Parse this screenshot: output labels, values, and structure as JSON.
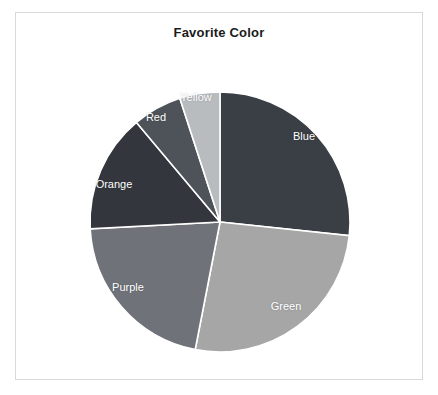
{
  "chart_data": {
    "type": "pie",
    "title": "Favorite Color",
    "xlabel": "",
    "ylabel": "",
    "legend_position": "none",
    "labels_inside": true,
    "categories": [
      "Blue",
      "Green",
      "Purple",
      "Orange",
      "Red",
      "Yellow"
    ],
    "values": [
      26.7,
      26.4,
      21.1,
      14.7,
      6.1,
      5.0
    ],
    "start_angle_deg": 0,
    "direction": "clockwise",
    "slices": [
      {
        "label": "Blue",
        "value": 26.7,
        "start_deg": 0,
        "end_deg": 96,
        "color": "#3a3f46",
        "label_x": 304,
        "label_y": 136
      },
      {
        "label": "Green",
        "value": 26.4,
        "start_deg": 96,
        "end_deg": 191,
        "color": "#a6a6a6",
        "label_x": 286,
        "label_y": 306
      },
      {
        "label": "Purple",
        "value": 21.1,
        "start_deg": 191,
        "end_deg": 267,
        "color": "#6f7379",
        "label_x": 128,
        "label_y": 287
      },
      {
        "label": "Orange",
        "value": 14.7,
        "start_deg": 267,
        "end_deg": 320,
        "color": "#33373d",
        "label_x": 114,
        "label_y": 184
      },
      {
        "label": "Red",
        "value": 6.1,
        "start_deg": 320,
        "end_deg": 342,
        "color": "#4e5359",
        "label_x": 156,
        "label_y": 117
      },
      {
        "label": "Yellow",
        "value": 5.0,
        "start_deg": 342,
        "end_deg": 360,
        "color": "#b9bcbf",
        "label_x": 196,
        "label_y": 97
      }
    ],
    "geometry": {
      "cx": 220,
      "cy": 222,
      "r": 130
    },
    "colors": {
      "background": "#ffffff",
      "frame_border": "#d9d9d9",
      "title_text": "#1b1b1b",
      "slice_label_text": "#ffffff",
      "slice_divider": "#ffffff"
    }
  }
}
